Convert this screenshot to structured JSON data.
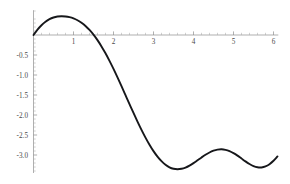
{
  "chart_data": {
    "type": "line",
    "title": "",
    "subtitle": "",
    "xlabel": "",
    "ylabel": "",
    "xlim": [
      0,
      6.12
    ],
    "ylim": [
      -3.45,
      0.62
    ],
    "grid": false,
    "legend": null,
    "legend_position": "none",
    "axis_origin": [
      0,
      0
    ],
    "x_major_ticks": [
      1,
      2,
      3,
      4,
      5,
      6
    ],
    "x_major_tick_labels": [
      "1",
      "2",
      "3",
      "4",
      "5",
      "6"
    ],
    "x_minor_tick_interval": 0.2,
    "y_major_ticks": [
      -0.5,
      -1.0,
      -1.5,
      -2.0,
      -2.5,
      -3.0
    ],
    "y_major_tick_labels": [
      "-0.5",
      "-1.0",
      "-1.5",
      "-2.0",
      "-2.5",
      "-3.0"
    ],
    "y_minor_tick_interval": 0.1,
    "curve_color": "#16171a",
    "axis_color": "#8e8e8e",
    "tick_label_color": "#4a4a4a",
    "annotations": [],
    "series": [
      {
        "name": "curve",
        "color": "#16171a",
        "x": [
          0.0,
          0.1,
          0.2,
          0.3,
          0.4,
          0.5,
          0.6,
          0.7,
          0.8,
          0.9,
          1.0,
          1.1,
          1.2,
          1.3,
          1.4,
          1.5,
          1.6,
          1.7,
          1.8,
          1.9,
          2.0,
          2.1,
          2.2,
          2.3,
          2.4,
          2.5,
          2.6,
          2.7,
          2.8,
          2.9,
          3.0,
          3.1,
          3.2,
          3.3,
          3.4,
          3.5,
          3.6,
          3.7,
          3.8,
          3.9,
          4.0,
          4.1,
          4.2,
          4.3,
          4.4,
          4.5,
          4.6,
          4.7,
          4.8,
          4.9,
          5.0,
          5.1,
          5.2,
          5.3,
          5.4,
          5.5,
          5.6,
          5.7,
          5.8,
          5.9,
          6.0,
          6.1
        ],
        "y": [
          0.0,
          0.133,
          0.243,
          0.33,
          0.395,
          0.438,
          0.462,
          0.47,
          0.464,
          0.446,
          0.415,
          0.369,
          0.307,
          0.227,
          0.128,
          0.01,
          -0.128,
          -0.285,
          -0.458,
          -0.647,
          -0.848,
          -1.06,
          -1.279,
          -1.503,
          -1.727,
          -1.949,
          -2.165,
          -2.372,
          -2.566,
          -2.744,
          -2.903,
          -3.041,
          -3.155,
          -3.244,
          -3.307,
          -3.344,
          -3.356,
          -3.345,
          -3.313,
          -3.264,
          -3.202,
          -3.133,
          -3.062,
          -2.995,
          -2.937,
          -2.893,
          -2.866,
          -2.858,
          -2.871,
          -2.903,
          -2.953,
          -3.016,
          -3.088,
          -3.16,
          -3.226,
          -3.277,
          -3.307,
          -3.311,
          -3.285,
          -3.229,
          -3.144,
          -3.036
        ]
      }
    ]
  },
  "plot_geometry": {
    "x_axis_pixel_y": 35,
    "y_axis_pixel_x": 33.5,
    "pixels_per_x_unit": 40,
    "pixels_per_y_unit": 40,
    "width": 290,
    "height": 184
  }
}
